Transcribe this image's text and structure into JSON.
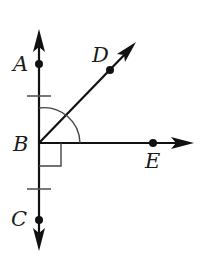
{
  "diagram": {
    "type": "geometry-angles",
    "colors": {
      "stroke": "#111111",
      "background": "#ffffff"
    },
    "points": {
      "A": {
        "label": "A",
        "x": 39,
        "y": 64
      },
      "B": {
        "label": "B",
        "x": 39,
        "y": 143
      },
      "C": {
        "label": "C",
        "x": 39,
        "y": 220
      },
      "D": {
        "label": "D",
        "x": 110,
        "y": 70
      },
      "E": {
        "label": "E",
        "x": 153,
        "y": 143
      }
    },
    "rays": [
      "BA",
      "BC",
      "BD",
      "BE"
    ],
    "markings": {
      "congruent_ticks": [
        "BA segment",
        "BC segment"
      ],
      "right_angle": "angle CBE",
      "arc": "angle ABE"
    }
  }
}
